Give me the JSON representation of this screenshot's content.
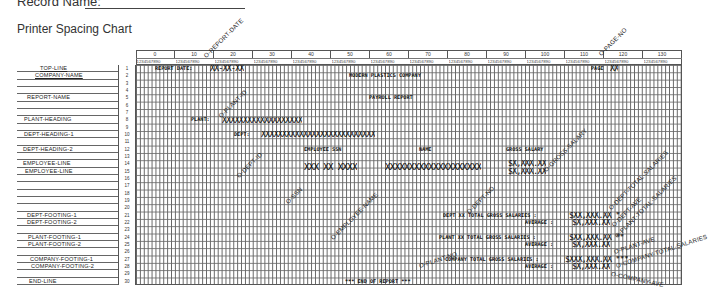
{
  "header": {
    "record_label": "Record Name:",
    "chart_title": "Printer Spacing Chart"
  },
  "columns": {
    "tens": [
      "0",
      "10",
      "20",
      "30",
      "40",
      "50",
      "60",
      "70",
      "80",
      "90",
      "100",
      "110",
      "120",
      "130"
    ],
    "units": "1234567890"
  },
  "rows": [
    {
      "n": "1",
      "label": "TOP-LINE"
    },
    {
      "n": "2",
      "label": "COMPANY-NAME"
    },
    {
      "n": "3",
      "label": ""
    },
    {
      "n": "4",
      "label": ""
    },
    {
      "n": "5",
      "label": "REPORT-NAME"
    },
    {
      "n": "6",
      "label": ""
    },
    {
      "n": "7",
      "label": ""
    },
    {
      "n": "8",
      "label": "PLANT-HEADING"
    },
    {
      "n": "9",
      "label": ""
    },
    {
      "n": "10",
      "label": "DEPT-HEADING-1"
    },
    {
      "n": "11",
      "label": ""
    },
    {
      "n": "12",
      "label": "DEPT-HEADING-2"
    },
    {
      "n": "13",
      "label": ""
    },
    {
      "n": "14",
      "label": "EMPLOYEE-LINE"
    },
    {
      "n": "15",
      "label": "EMPLOYEE-LINE"
    },
    {
      "n": "16",
      "label": ""
    },
    {
      "n": "17",
      "label": ""
    },
    {
      "n": "18",
      "label": ""
    },
    {
      "n": "19",
      "label": ""
    },
    {
      "n": "20",
      "label": ""
    },
    {
      "n": "21",
      "label": "DEPT-FOOTING-1"
    },
    {
      "n": "22",
      "label": "DEPT-FOOTING-2"
    },
    {
      "n": "23",
      "label": ""
    },
    {
      "n": "24",
      "label": "PLANT-FOOTING-1"
    },
    {
      "n": "25",
      "label": "PLANT-FOOTING-2"
    },
    {
      "n": "26",
      "label": ""
    },
    {
      "n": "27",
      "label": "COMPANY-FOOTING-1"
    },
    {
      "n": "28",
      "label": "COMPANY-FOOTING-2"
    },
    {
      "n": "29",
      "label": ""
    },
    {
      "n": "30",
      "label": "END-LINE"
    }
  ],
  "content": {
    "report_date_label": "REPORT DATE:",
    "report_date_field": "XX-XX-XX",
    "page_label": "PAGE",
    "page_field": "XX",
    "company_name": "MODERN PLASTICS COMPANY",
    "report_name": "PAYROLL REPORT",
    "plant_label": "PLANT:",
    "plant_field": "XXXXXXXXXXXXXXXXXXX",
    "dept_label": "DEPT:",
    "dept_field": "XXXXXXXXXXXXXXXXXXXXXXXXXXX",
    "col_ssn": "EMPLOYEE SSN",
    "col_name": "NAME",
    "col_salary": "GROSS SALARY",
    "ssn_field": "XXX XX XXXX",
    "name_field": "XXXXXXXXXXXXXXXXXXXX",
    "salary_field_1": "$X,XXX.XX",
    "salary_field_2": "$X,XXX.XX",
    "dept_total_text": "DEPT XX TOTAL GROSS SALARIES :",
    "dept_total_field": "$XX,XXX.XX *",
    "dept_avg_text": "AVERAGE :",
    "dept_avg_field": "$X,XXX.XX",
    "plant_total_text": "PLANT XX TOTAL GROSS SALARIES :",
    "plant_total_field": "$XX,XXX.XX **",
    "plant_avg_text": "AVERAGE :",
    "plant_avg_field": "$X,XXX.XX",
    "company_total_text": "COMPANY TOTAL GROSS SALARIES :",
    "company_total_field": "$XXX,XXX.XX ***",
    "company_avg_text": "AVERAGE :",
    "company_avg_field": "$X,XXX.XX",
    "end_line": "*** END OF REPORT ***"
  },
  "annotations": {
    "report_date": "O-REPORT-DATE",
    "page_no": "O-PAGE-NO",
    "plant_id": "O-PLANT-ID",
    "dept_id": "O-DEPT-ID",
    "ssn": "O-SSN",
    "employee_name": "O-EMPLOYEE-NAME",
    "dept_no": "O-DEPT-NO",
    "gross_salary": "O-GROSS-SALARY",
    "dept_total_salaries": "O-DEPT-TOTAL-SALARIES",
    "dept_ave": "O-DEPT-AVE",
    "plant_total_salaries": "O-PLANT-TOTAL-SALARIES",
    "plant_no": "O-PLANT-NO",
    "plant_ave": "O-PLANT-AVE",
    "company_total_salaries": "O-COMPANY-TOTAL-SALARIES",
    "company_ave": "O-COMPANY-AVE"
  }
}
